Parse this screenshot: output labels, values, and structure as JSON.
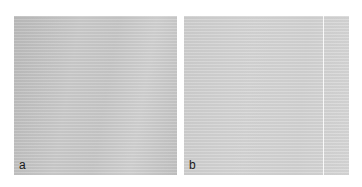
{
  "figure": {
    "panels": [
      {
        "id": "a",
        "label": "a",
        "fill": "#c8c8c8"
      },
      {
        "id": "b",
        "label": "b",
        "fill": "#d4d4d4"
      }
    ]
  }
}
